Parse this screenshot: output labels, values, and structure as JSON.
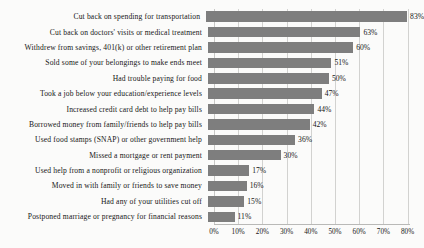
{
  "chart_data": {
    "type": "bar",
    "orientation": "horizontal",
    "title": "",
    "subtitle": "",
    "xlabel": "",
    "ylabel": "",
    "xlim": [
      0,
      80
    ],
    "grid": true,
    "legend": null,
    "value_suffix": "%",
    "bar_color": "#7e7e7e",
    "background_color": "#fbfbfa",
    "gridline_color": "#d2d2d0",
    "tick_labels": [
      "0%",
      "10%",
      "20%",
      "30%",
      "40%",
      "50%",
      "60%",
      "70%",
      "80%"
    ],
    "ticks": [
      0,
      10,
      20,
      30,
      40,
      50,
      60,
      70,
      80
    ],
    "categories": [
      "Cut back on spending for transportation",
      "Cut back on doctors' visits or medical treatment",
      "Withdrew from savings, 401(k) or other retirement plan",
      "Sold some of your belongings to make ends meet",
      "Had trouble paying for food",
      "Took a job below your education/experience levels",
      "Increased credit card debt to help pay bills",
      "Borrowed money from family/friends to help pay bills",
      "Used food stamps (SNAP) or other government help",
      "Missed a mortgage or rent payment",
      "Used help from a nonprofit or religious organization",
      "Moved in with family or friends to save money",
      "Had any of your utilities cut off",
      "Postponed marriage or pregnancy for financial reasons"
    ],
    "values": [
      83,
      63,
      60,
      51,
      50,
      47,
      44,
      42,
      36,
      30,
      17,
      16,
      15,
      11
    ],
    "value_labels": [
      "83%",
      "63%",
      "60%",
      "51%",
      "50%",
      "47%",
      "44%",
      "42%",
      "36%",
      "30%",
      "17%",
      "16%",
      "15%",
      "11%"
    ]
  }
}
